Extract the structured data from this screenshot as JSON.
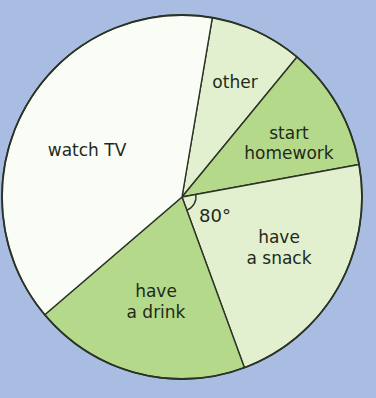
{
  "colors": {
    "background": "#a9bde2",
    "white": "#fafdf5",
    "light_green": "#e2f0cf",
    "medium_green": "#b5d98a",
    "outline": "#2b3326"
  },
  "angle_annotation": {
    "label": "80°",
    "slice": "have a snack"
  },
  "chart_data": {
    "type": "pie",
    "title": "",
    "units": "degrees",
    "start_angle_deg_clockwise_from_east": 279.7,
    "categories": [
      "other",
      "start homework",
      "have a snack",
      "have a drink",
      "watch TV"
    ],
    "values": [
      30,
      40,
      80,
      70,
      140
    ],
    "labels_lines": [
      [
        "other"
      ],
      [
        "start",
        "homework"
      ],
      [
        "have",
        "a snack"
      ],
      [
        "have",
        "a drink"
      ],
      [
        "watch TV"
      ]
    ],
    "fills": [
      "light_green",
      "medium_green",
      "light_green",
      "medium_green",
      "white"
    ],
    "annotations": [
      "80° angle marked at centre for 'have a snack'"
    ],
    "legend": "none (labels inside slices)"
  },
  "labels": {
    "other": "other",
    "start_homework_1": "start",
    "start_homework_2": "homework",
    "have_a_snack_1": "have",
    "have_a_snack_2": "a snack",
    "have_a_drink_1": "have",
    "have_a_drink_2": "a drink",
    "watch_tv": "watch TV"
  }
}
